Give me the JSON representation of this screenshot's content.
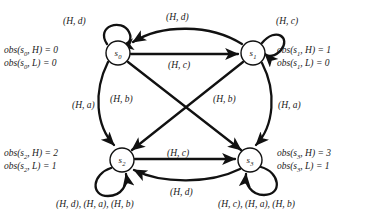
{
  "diagram": {
    "stroke_color": "#111111",
    "node_fill": "#ffffff",
    "background": "#ffffff",
    "nodes": [
      {
        "id": "s0",
        "label": "s",
        "sub": "0",
        "cx": 118,
        "cy": 53,
        "r": 12
      },
      {
        "id": "s1",
        "label": "s",
        "sub": "1",
        "cx": 253,
        "cy": 53,
        "r": 12
      },
      {
        "id": "s2",
        "label": "s",
        "sub": "2",
        "cx": 122,
        "cy": 160,
        "r": 12
      },
      {
        "id": "s3",
        "label": "s",
        "sub": "3",
        "cx": 250,
        "cy": 160,
        "r": 12
      }
    ],
    "observations": [
      {
        "node": "s0",
        "lines": [
          "obs(s0, H) = 0",
          "obs(s0, L) = 0"
        ],
        "high_label": "obs(s",
        "high_sub": "0",
        "high_rest": ", H) = 0",
        "low_label": "obs(s",
        "low_sub": "0",
        "low_rest": ", L) = 0",
        "x": 4,
        "y": 45,
        "align": "left"
      },
      {
        "node": "s1",
        "lines": [
          "obs(s1, H) = 1",
          "obs(s1, L) = 0"
        ],
        "high_label": "obs(s",
        "high_sub": "1",
        "high_rest": ", H) = 1",
        "low_label": "obs(s",
        "low_sub": "1",
        "low_rest": ", L) = 0",
        "x": 277,
        "y": 45,
        "align": "left"
      },
      {
        "node": "s2",
        "lines": [
          "obs(s2, H) = 2",
          "obs(s2, L) = 1"
        ],
        "high_label": "obs(s",
        "high_sub": "2",
        "high_rest": ", H) = 2",
        "low_label": "obs(s",
        "low_sub": "2",
        "low_rest": ", L) = 1",
        "x": 4,
        "y": 148,
        "align": "left"
      },
      {
        "node": "s3",
        "lines": [
          "obs(s3, H) = 3",
          "obs(s3, L) = 1"
        ],
        "high_label": "obs(s",
        "high_sub": "3",
        "high_rest": ", H) = 3",
        "low_label": "obs(s",
        "low_sub": "3",
        "low_rest": ", L) = 1",
        "x": 277,
        "y": 148,
        "align": "left"
      }
    ],
    "edges": [
      {
        "id": "s0-self",
        "from": "s0",
        "to": "s0",
        "label": "(H, d)",
        "kind": "self-loop",
        "lx": 63,
        "ly": 16
      },
      {
        "id": "s1-self",
        "from": "s1",
        "to": "s1",
        "label": "(H, c)",
        "kind": "self-loop",
        "lx": 276,
        "ly": 16
      },
      {
        "id": "s2-self",
        "from": "s2",
        "to": "s2",
        "label": "(H, d), (H, a), (H, b)",
        "kind": "self-loop",
        "lx": 56,
        "ly": 199
      },
      {
        "id": "s3-self",
        "from": "s3",
        "to": "s3",
        "label": "(H, c), (H, a), (H, b)",
        "kind": "self-loop",
        "lx": 218,
        "ly": 199
      },
      {
        "id": "s1-to-s0",
        "from": "s1",
        "to": "s0",
        "label": "(H, d)",
        "kind": "arc-top",
        "lx": 166,
        "ly": 12
      },
      {
        "id": "s0-to-s1",
        "from": "s0",
        "to": "s1",
        "label": "(H, c)",
        "kind": "straight",
        "lx": 168,
        "ly": 60
      },
      {
        "id": "s0-to-s2",
        "from": "s0",
        "to": "s2",
        "label": "(H, a)",
        "kind": "arc-left",
        "lx": 72,
        "ly": 100
      },
      {
        "id": "s1-to-s3",
        "from": "s1",
        "to": "s3",
        "label": "(H, a)",
        "kind": "arc-right",
        "lx": 278,
        "ly": 100
      },
      {
        "id": "s0-to-s3",
        "from": "s0",
        "to": "s3",
        "label": "(H, b)",
        "kind": "diagonal",
        "lx": 110,
        "ly": 94
      },
      {
        "id": "s1-to-s2",
        "from": "s1",
        "to": "s2",
        "label": "(H, b)",
        "kind": "diagonal",
        "lx": 213,
        "ly": 94
      },
      {
        "id": "s2-to-s3",
        "from": "s2",
        "to": "s3",
        "label": "(H, c)",
        "kind": "straight",
        "lx": 167,
        "ly": 148
      },
      {
        "id": "s3-to-s2",
        "from": "s3",
        "to": "s2",
        "label": "(H, d)",
        "kind": "arc-bottom",
        "lx": 170,
        "ly": 187
      }
    ]
  }
}
